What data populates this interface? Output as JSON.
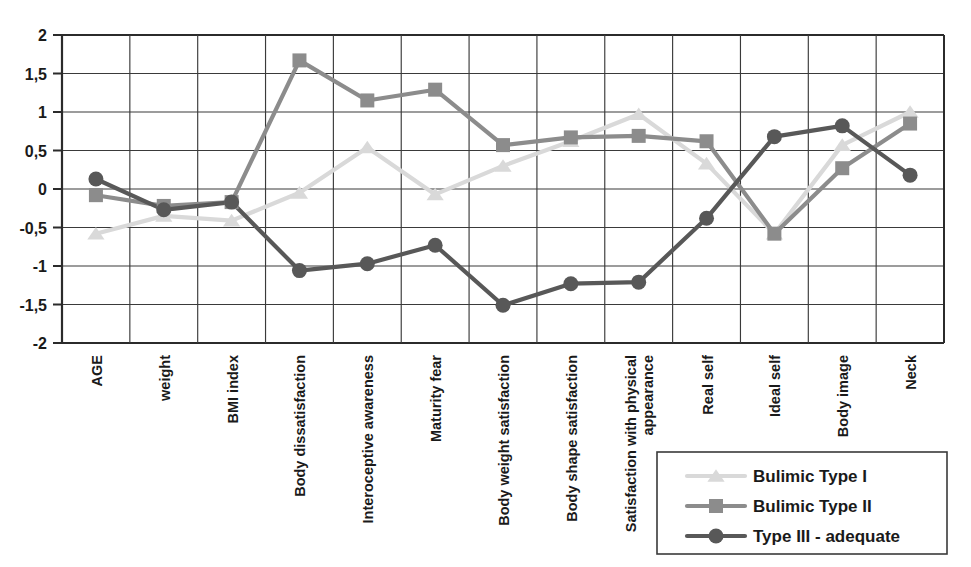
{
  "chart_data": {
    "type": "line",
    "title": "",
    "subtitle": "",
    "xlabel": "",
    "ylabel": "",
    "ylim": [
      -2,
      2
    ],
    "ytick_labels": [
      "2",
      "1,5",
      "1",
      "0,5",
      "0",
      "-0,5",
      "-1",
      "-1,5",
      "-2"
    ],
    "ytick_values": [
      2,
      1.5,
      1,
      0.5,
      0,
      -0.5,
      -1,
      -1.5,
      -2
    ],
    "grid": true,
    "legend_position": "bottom-right",
    "categories": [
      "AGE",
      "weight",
      "BMI index",
      "Body dissatisfaction",
      "Interoceptive awareness",
      "Maturity fear",
      "Body weight satisfaction",
      "Body shape satisfaction",
      "Satisfaction with physical appearance",
      "Real self",
      "Ideal self",
      "Body image",
      "Neck"
    ],
    "series": [
      {
        "name": "Bulimic Type I",
        "color": "#d9d9d9",
        "marker": "triangle",
        "values": [
          -0.58,
          -0.35,
          -0.41,
          -0.05,
          0.54,
          -0.07,
          0.3,
          0.62,
          0.97,
          0.33,
          -0.58,
          0.57,
          1.0
        ]
      },
      {
        "name": "Bulimic Type II",
        "color": "#8c8c8c",
        "marker": "square",
        "values": [
          -0.08,
          -0.22,
          -0.17,
          1.67,
          1.15,
          1.29,
          0.57,
          0.67,
          0.69,
          0.62,
          -0.58,
          0.27,
          0.85
        ]
      },
      {
        "name": "Type III - adequate",
        "color": "#585858",
        "marker": "circle",
        "values": [
          0.13,
          -0.27,
          -0.17,
          -1.06,
          -0.97,
          -0.73,
          -1.51,
          -1.23,
          -1.21,
          -0.38,
          0.68,
          0.82,
          0.18
        ]
      }
    ]
  },
  "legend": {
    "entries": [
      {
        "label": "Bulimic Type I"
      },
      {
        "label": "Bulimic Type II"
      },
      {
        "label": "Type III - adequate"
      }
    ]
  }
}
